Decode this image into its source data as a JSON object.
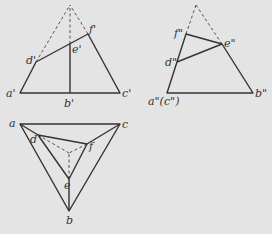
{
  "diagram": {
    "type": "orthographic-projection",
    "colors": {
      "line": "#333333",
      "background": "#e4e4e4"
    },
    "front_view": {
      "labels": {
        "a": "a'",
        "b": "b'",
        "c": "c'",
        "d": "d'",
        "e": "e'",
        "f": "f'"
      },
      "points": {
        "apex": [
          70,
          5
        ],
        "a": [
          20,
          93
        ],
        "b": [
          70,
          93
        ],
        "c": [
          120,
          93
        ],
        "d": [
          36,
          62
        ],
        "e": [
          70,
          44
        ],
        "f": [
          88,
          34
        ]
      }
    },
    "side_view": {
      "labels": {
        "ac": "a\"(c\")",
        "b": "b\"",
        "d": "d\"",
        "e": "e\"",
        "f": "f\""
      },
      "points": {
        "apex": [
          196,
          5
        ],
        "ac": [
          167,
          93
        ],
        "b": [
          253,
          93
        ],
        "d": [
          177,
          62
        ],
        "e": [
          222,
          44
        ],
        "f": [
          186,
          34
        ]
      }
    },
    "top_view": {
      "labels": {
        "a": "a",
        "b": "b",
        "c": "c",
        "d": "d",
        "e": "e",
        "f": "f"
      },
      "points": {
        "a": [
          20,
          124
        ],
        "b": [
          69,
          211
        ],
        "c": [
          120,
          124
        ],
        "d": [
          38,
          135
        ],
        "e": [
          69,
          179
        ],
        "f": [
          87,
          144
        ],
        "apex": [
          69,
          153
        ]
      }
    }
  }
}
